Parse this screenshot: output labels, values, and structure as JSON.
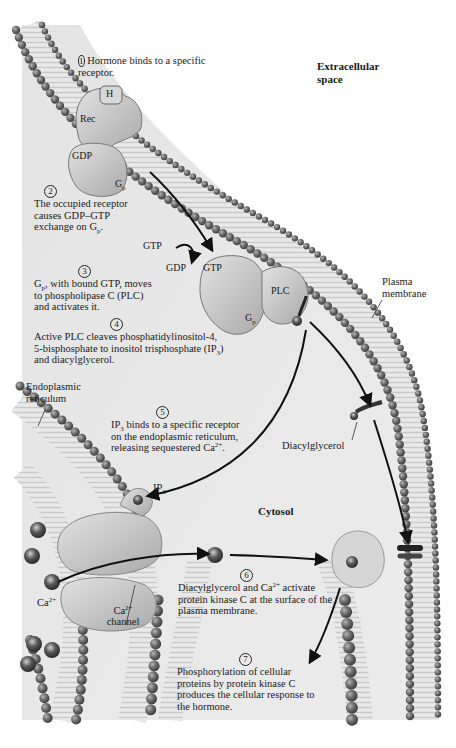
{
  "figure": {
    "regions": {
      "extracellular": "Extracellular space",
      "cytosol": "Cytosol"
    },
    "structures": {
      "plasma_membrane": "Plasma membrane",
      "er": "Endoplasmic reticulum",
      "diacylglycerol": "Diacylglycerol",
      "ca_ion": "Ca",
      "ca_ion_charge": "2+",
      "ca_channel_top": "Ca",
      "ca_channel_charge": "2+",
      "ca_channel_bottom": "channel",
      "ip3": "IP",
      "ip3_sub": "3"
    },
    "proteins": {
      "hormone": "H",
      "receptor": "Rec",
      "gdp_bound": "GDP",
      "gp_inactive": "G",
      "gp_inactive_sub": "p",
      "gtp_in": "GTP",
      "gdp_out": "GDP",
      "gtp_bound": "GTP",
      "plc": "PLC",
      "gp_active": "G",
      "gp_active_sub": "p"
    },
    "steps": [
      {
        "num": "1",
        "text": "Hormone binds to a specific receptor."
      },
      {
        "num": "2",
        "text_a": "The occupied receptor causes GDP–GTP exchange on G",
        "sub": "p",
        "text_b": "."
      },
      {
        "num": "3",
        "pre": "G",
        "sub": "p",
        "text": ", with bound GTP, moves to phospholipase C (PLC) and activates it."
      },
      {
        "num": "4",
        "text_a": "Active PLC cleaves phosphatidylinositol-4, 5-bisphosphate to inositol trisphosphate (IP",
        "sub": "3",
        "text_b": ") and diacylglycerol."
      },
      {
        "num": "5",
        "pre": "IP",
        "sub": "3",
        "text_a": " binds to a specific receptor on the endoplasmic reticulum, releasing sequestered Ca",
        "sup": "2+",
        "text_b": "."
      },
      {
        "num": "6",
        "text_a": "Diacylglycerol and Ca",
        "sup": "2+",
        "text_b": " activate protein kinase C at the surface of the plasma membrane."
      },
      {
        "num": "7",
        "text": "Phosphorylation of cellular proteins by protein kinase C produces the cellular response to the hormone."
      }
    ]
  }
}
